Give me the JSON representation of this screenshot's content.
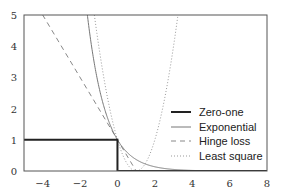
{
  "chart_data": {
    "type": "line",
    "title": "",
    "xlabel": "",
    "ylabel": "",
    "xlim": [
      -5,
      8
    ],
    "ylim": [
      0,
      5
    ],
    "grid": false,
    "legend_position": "lower right",
    "x_ticks": [
      -4,
      -2,
      0,
      2,
      4,
      6,
      8
    ],
    "x_tick_labels": [
      "−4",
      "−2",
      "0",
      "2",
      "4",
      "6",
      "8"
    ],
    "y_ticks": [
      0,
      1,
      2,
      3,
      4,
      5
    ],
    "y_tick_labels": [
      "0",
      "1",
      "2",
      "3",
      "4",
      "5"
    ],
    "series": [
      {
        "name": "Zero-one",
        "style": "solid-thick",
        "color": "#222222",
        "function": "1 if x<0 else 0",
        "x": [
          -5,
          0,
          0,
          8
        ],
        "y": [
          1,
          1,
          0,
          0
        ]
      },
      {
        "name": "Exponential",
        "style": "solid-thin",
        "color": "#777777",
        "function": "exp(-x)",
        "x": [
          -1.609,
          -1.5,
          -1,
          -0.5,
          0,
          0.5,
          1,
          2,
          3,
          4,
          8
        ],
        "y": [
          5,
          4.48,
          2.72,
          1.65,
          1,
          0.61,
          0.37,
          0.14,
          0.05,
          0.02,
          0
        ]
      },
      {
        "name": "Hinge loss",
        "style": "dashed",
        "color": "#888888",
        "function": "max(0, 1-x)",
        "x": [
          -4,
          1,
          8
        ],
        "y": [
          5,
          0,
          0
        ]
      },
      {
        "name": "Least square",
        "style": "dotted",
        "color": "#999999",
        "function": "(1-x)^2",
        "x": [
          -1.236,
          -1,
          -0.5,
          0,
          0.5,
          1,
          1.5,
          2,
          2.5,
          3,
          3.236
        ],
        "y": [
          5,
          4,
          2.25,
          1,
          0.25,
          0,
          0.25,
          1,
          2.25,
          4,
          5
        ]
      }
    ]
  },
  "legend": {
    "items": [
      {
        "label": "Zero-one"
      },
      {
        "label": "Exponential"
      },
      {
        "label": "Hinge loss"
      },
      {
        "label": "Least square"
      }
    ]
  }
}
